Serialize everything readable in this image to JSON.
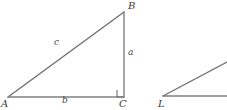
{
  "figure": {
    "kind": "geometry-diagram",
    "background_color": "#ffffff",
    "line_color": "#808080",
    "label_color": "#3a3a3a",
    "width": 227,
    "height": 110
  },
  "triangle_abc": {
    "vertices": [
      {
        "name": "A",
        "label": "A",
        "x": 8,
        "y": 97,
        "label_x": 1,
        "label_y": 99
      },
      {
        "name": "B",
        "label": "B",
        "x": 124,
        "y": 12,
        "label_x": 128,
        "label_y": 1
      },
      {
        "name": "C",
        "label": "C",
        "x": 124,
        "y": 97,
        "label_x": 119,
        "label_y": 99
      }
    ],
    "sides": [
      {
        "name": "hypotenuse",
        "label": "c",
        "from": "A",
        "to": "B",
        "label_x": 54,
        "label_y": 38
      },
      {
        "name": "opposite",
        "label": "a",
        "from": "B",
        "to": "C",
        "label_x": 128,
        "label_y": 48
      },
      {
        "name": "adjacent",
        "label": "b",
        "from": "A",
        "to": "C",
        "label_x": 62,
        "label_y": 96
      }
    ],
    "right_angle": {
      "at": "C",
      "marker_x": 117,
      "marker_y": 90,
      "marker_size": 7
    }
  },
  "figure_l": {
    "vertices": [
      {
        "name": "L",
        "label": "L",
        "x": 163,
        "y": 96,
        "label_x": 158,
        "label_y": 99
      }
    ],
    "rays": [
      {
        "name": "base-ray",
        "from_x": 163,
        "from_y": 96,
        "to_x": 227,
        "to_y": 96
      },
      {
        "name": "upper-ray",
        "from_x": 163,
        "from_y": 96,
        "to_x": 227,
        "to_y": 62
      }
    ]
  }
}
